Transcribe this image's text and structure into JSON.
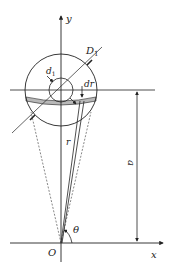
{
  "diagram": {
    "type": "geometric-annulus-integration",
    "labels": {
      "y_axis": "y",
      "x_axis": "x",
      "origin": "O",
      "outer_diameter": "D",
      "outer_diameter_sub": "1",
      "inner_diameter": "d",
      "inner_diameter_sub": "1",
      "ring_width": "dr",
      "radius": "r",
      "distance": "a",
      "angle": "θ"
    },
    "colors": {
      "line": "#222222",
      "dashed": "#555555",
      "background": "#ffffff"
    }
  }
}
